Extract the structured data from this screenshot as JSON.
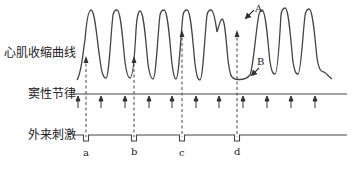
{
  "diagram": {
    "row_labels": {
      "curve": "心肌收缩曲线",
      "sinus": "窦性节律",
      "stimulus": "外来刺激"
    },
    "annotations": {
      "A": "A",
      "B": "B"
    },
    "stimulus_marks": [
      "a",
      "b",
      "c",
      "d"
    ],
    "colors": {
      "line": "#333333",
      "text": "#222222",
      "background": "#ffffff"
    }
  }
}
